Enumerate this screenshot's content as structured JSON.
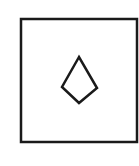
{
  "figure": {
    "background": "#ffffff",
    "stroke_color": "#1a1a1a",
    "frame": {
      "shape": "square",
      "x": 21,
      "y": 19,
      "width": 116,
      "height": 123,
      "stroke_width": 2.5
    },
    "inner_shape": {
      "shape": "kite",
      "points": "79,57 62,87 79,103 97,88",
      "stroke_width": 2.5
    }
  }
}
